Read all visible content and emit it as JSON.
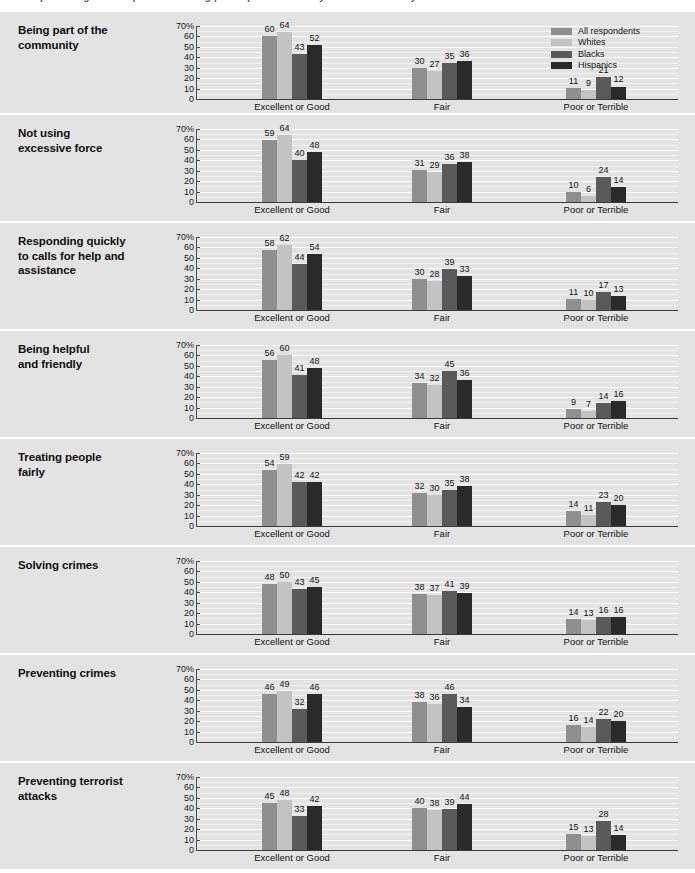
{
  "top_clipped_text": "percentages of respondents rating police performance by race and ethnicity",
  "legend": {
    "position": "top-right-panel-1",
    "items": [
      {
        "label": "All respondents",
        "color": "#8f8f8f"
      },
      {
        "label": "Whites",
        "color": "#c3c3c3"
      },
      {
        "label": "Blacks",
        "color": "#5a5a5a"
      },
      {
        "label": "Hispanics",
        "color": "#2a2a2a"
      }
    ]
  },
  "axis": {
    "y_ticks": [
      "70%",
      "60",
      "50",
      "40",
      "30",
      "20",
      "10",
      "0"
    ],
    "y_values": [
      70,
      60,
      50,
      40,
      30,
      20,
      10,
      0
    ],
    "ylim": [
      0,
      70
    ],
    "categories": [
      "Excellent or Good",
      "Fair",
      "Poor or Terrible"
    ]
  },
  "chart_data": {
    "type": "bar",
    "title": "",
    "subtitle": "",
    "xlabel": "",
    "ylabel": "",
    "ylim": [
      0,
      70
    ],
    "grid": true,
    "legend_position": "top-right",
    "categories": [
      "Excellent or Good",
      "Fair",
      "Poor or Terrible"
    ],
    "series_names": [
      "All respondents",
      "Whites",
      "Blacks",
      "Hispanics"
    ],
    "panels": [
      {
        "label": "Being part of the\ncommunity",
        "label_lines": [
          "Being part of the",
          "community"
        ],
        "groups": [
          {
            "category": "Excellent or Good",
            "values": [
              60,
              64,
              43,
              52
            ]
          },
          {
            "category": "Fair",
            "values": [
              30,
              27,
              35,
              36
            ]
          },
          {
            "category": "Poor or Terrible",
            "values": [
              11,
              9,
              21,
              12
            ]
          }
        ]
      },
      {
        "label": "Not using\nexcessive force",
        "label_lines": [
          "Not using",
          "excessive force"
        ],
        "groups": [
          {
            "category": "Excellent or Good",
            "values": [
              59,
              64,
              40,
              48
            ]
          },
          {
            "category": "Fair",
            "values": [
              31,
              29,
              36,
              38
            ]
          },
          {
            "category": "Poor or Terrible",
            "values": [
              10,
              6,
              24,
              14
            ]
          }
        ]
      },
      {
        "label": "Responding quickly\nto calls for help and\nassistance",
        "label_lines": [
          "Responding quickly",
          "to calls for help and",
          "assistance"
        ],
        "groups": [
          {
            "category": "Excellent or Good",
            "values": [
              58,
              62,
              44,
              54
            ]
          },
          {
            "category": "Fair",
            "values": [
              30,
              28,
              39,
              33
            ]
          },
          {
            "category": "Poor or Terrible",
            "values": [
              11,
              10,
              17,
              13
            ]
          }
        ]
      },
      {
        "label": "Being helpful\nand friendly",
        "label_lines": [
          "Being helpful",
          "and friendly"
        ],
        "groups": [
          {
            "category": "Excellent or Good",
            "values": [
              56,
              60,
              41,
              48
            ]
          },
          {
            "category": "Fair",
            "values": [
              34,
              32,
              45,
              36
            ]
          },
          {
            "category": "Poor or Terrible",
            "values": [
              9,
              7,
              14,
              16
            ]
          }
        ]
      },
      {
        "label": "Treating people\nfairly",
        "label_lines": [
          "Treating people",
          "fairly"
        ],
        "groups": [
          {
            "category": "Excellent or Good",
            "values": [
              54,
              59,
              42,
              42
            ]
          },
          {
            "category": "Fair",
            "values": [
              32,
              30,
              35,
              38
            ]
          },
          {
            "category": "Poor or Terrible",
            "values": [
              14,
              11,
              23,
              20
            ]
          }
        ]
      },
      {
        "label": "Solving crimes",
        "label_lines": [
          "Solving crimes"
        ],
        "groups": [
          {
            "category": "Excellent or Good",
            "values": [
              48,
              50,
              43,
              45
            ]
          },
          {
            "category": "Fair",
            "values": [
              38,
              37,
              41,
              39
            ]
          },
          {
            "category": "Poor or Terrible",
            "values": [
              14,
              13,
              16,
              16
            ]
          }
        ]
      },
      {
        "label": "Preventing crimes",
        "label_lines": [
          "Preventing crimes"
        ],
        "groups": [
          {
            "category": "Excellent or Good",
            "values": [
              46,
              49,
              32,
              46
            ]
          },
          {
            "category": "Fair",
            "values": [
              38,
              36,
              46,
              34
            ]
          },
          {
            "category": "Poor or Terrible",
            "values": [
              16,
              14,
              22,
              20
            ]
          }
        ]
      },
      {
        "label": "Preventing terrorist\nattacks",
        "label_lines": [
          "Preventing terrorist",
          "attacks"
        ],
        "groups": [
          {
            "category": "Excellent or Good",
            "values": [
              45,
              48,
              33,
              42
            ]
          },
          {
            "category": "Fair",
            "values": [
              40,
              38,
              39,
              44
            ]
          },
          {
            "category": "Poor or Terrible",
            "values": [
              15,
              13,
              28,
              14
            ]
          }
        ]
      }
    ]
  }
}
